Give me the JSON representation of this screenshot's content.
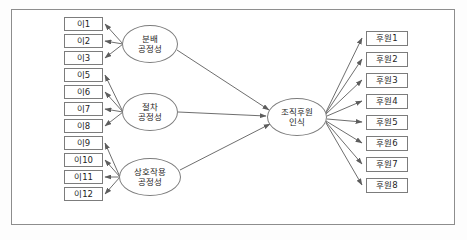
{
  "diagram": {
    "type": "structural-equation-model-path-diagram",
    "frame": {
      "border_color": "#8d8d8d",
      "background": "#ffffff"
    },
    "left_indicators": [
      {
        "label": "이1",
        "x": 64,
        "y": 17
      },
      {
        "label": "이2",
        "x": 64,
        "y": 34
      },
      {
        "label": "이3",
        "x": 64,
        "y": 51
      },
      {
        "label": "이5",
        "x": 64,
        "y": 68
      },
      {
        "label": "이6",
        "x": 64,
        "y": 85
      },
      {
        "label": "이7",
        "x": 64,
        "y": 102
      },
      {
        "label": "이8",
        "x": 64,
        "y": 119
      },
      {
        "label": "이9",
        "x": 64,
        "y": 136
      },
      {
        "label": "이10",
        "x": 64,
        "y": 153
      },
      {
        "label": "이11",
        "x": 64,
        "y": 170
      },
      {
        "label": "이12",
        "x": 64,
        "y": 187
      }
    ],
    "right_indicators": [
      {
        "label": "후원1",
        "x": 366,
        "y": 31
      },
      {
        "label": "후원2",
        "x": 366,
        "y": 52
      },
      {
        "label": "후원3",
        "x": 366,
        "y": 73
      },
      {
        "label": "후원4",
        "x": 366,
        "y": 94
      },
      {
        "label": "후원5",
        "x": 366,
        "y": 115
      },
      {
        "label": "후원6",
        "x": 366,
        "y": 136
      },
      {
        "label": "후원7",
        "x": 366,
        "y": 157
      },
      {
        "label": "후원8",
        "x": 366,
        "y": 178
      }
    ],
    "latent_factors": [
      {
        "id": "distributive-justice",
        "line1": "분배",
        "line2": "공정성",
        "cx": 150,
        "cy": 44,
        "rx": 28,
        "ry": 19,
        "indicators": [
          "이1",
          "이2",
          "이3"
        ]
      },
      {
        "id": "procedural-justice",
        "line1": "절차",
        "line2": "공정성",
        "cx": 150,
        "cy": 112,
        "rx": 28,
        "ry": 19,
        "indicators": [
          "이5",
          "이6",
          "이7",
          "이8"
        ]
      },
      {
        "id": "interactional-justice",
        "line1": "상호작용",
        "line2": "공정성",
        "cx": 150,
        "cy": 177,
        "rx": 31,
        "ry": 19,
        "indicators": [
          "이9",
          "이10",
          "이11",
          "이12"
        ]
      }
    ],
    "endogenous_factor": {
      "id": "perceived-organizational-support",
      "line1": "조직후원",
      "line2": "인식",
      "cx": 297,
      "cy": 117,
      "rx": 30,
      "ry": 19,
      "measured_by": [
        "후원1",
        "후원2",
        "후원3",
        "후원4",
        "후원5",
        "후원6",
        "후원7",
        "후원8"
      ],
      "predicted_by": [
        "분배공정성",
        "절차공정성",
        "상호작용공정성"
      ]
    },
    "paths": {
      "structural_arrow_color": "#5d5d5d",
      "measurement_arrow_color": "#5d5d5d"
    }
  }
}
